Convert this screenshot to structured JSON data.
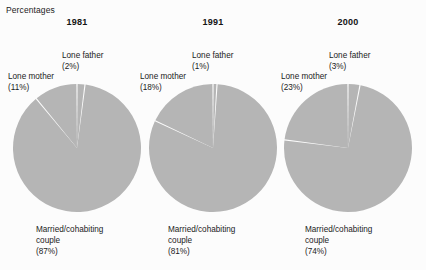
{
  "units_label": "Percentages",
  "colors": {
    "slice_fill": "#b5b5b5",
    "separator": "#ffffff",
    "background": "#fcfcfc",
    "text": "#1b1b1b"
  },
  "panels": [
    {
      "year": "1981",
      "father_label": "Lone father",
      "father_pct": "(2%)",
      "mother_label": "Lone mother",
      "mother_pct": "(11%)",
      "couple_label_line1": "Married/cohabiting",
      "couple_label_line2": "couple",
      "couple_pct": "(87%)"
    },
    {
      "year": "1991",
      "father_label": "Lone father",
      "father_pct": "(1%)",
      "mother_label": "Lone mother",
      "mother_pct": "(18%)",
      "couple_label_line1": "Married/cohabiting",
      "couple_label_line2": "couple",
      "couple_pct": "(81%)"
    },
    {
      "year": "2000",
      "father_label": "Lone father",
      "father_pct": "(3%)",
      "mother_label": "Lone mother",
      "mother_pct": "(23%)",
      "couple_label_line1": "Married/cohabiting",
      "couple_label_line2": "couple",
      "couple_pct": "(74%)"
    }
  ],
  "chart_data": [
    {
      "type": "pie",
      "title": "1981",
      "ylabel": "Percentages",
      "categories": [
        "Lone father",
        "Married/cohabiting couple",
        "Lone mother"
      ],
      "values": [
        2,
        87,
        11
      ],
      "units": "percent",
      "start_angle_deg": 0,
      "direction": "clockwise",
      "legend": "none",
      "grid": false
    },
    {
      "type": "pie",
      "title": "1991",
      "ylabel": "Percentages",
      "categories": [
        "Lone father",
        "Married/cohabiting couple",
        "Lone mother"
      ],
      "values": [
        1,
        81,
        18
      ],
      "units": "percent",
      "start_angle_deg": 0,
      "direction": "clockwise",
      "legend": "none",
      "grid": false
    },
    {
      "type": "pie",
      "title": "2000",
      "ylabel": "Percentages",
      "categories": [
        "Lone father",
        "Married/cohabiting couple",
        "Lone mother"
      ],
      "values": [
        3,
        74,
        23
      ],
      "units": "percent",
      "start_angle_deg": 0,
      "direction": "clockwise",
      "legend": "none",
      "grid": false
    }
  ]
}
